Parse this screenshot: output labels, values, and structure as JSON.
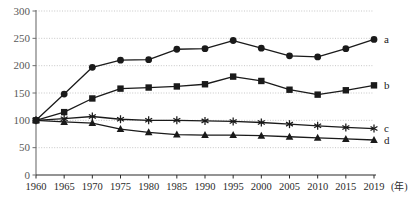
{
  "chart_data": {
    "type": "line",
    "title": "",
    "subtitle": "",
    "xlabel": "",
    "ylabel": "",
    "x_unit": "(年)",
    "grid": true,
    "legend_position": "right-inline",
    "xlim": [
      1960,
      2019
    ],
    "ylim": [
      0,
      300
    ],
    "yticks": [
      0,
      50,
      100,
      150,
      200,
      250,
      300
    ],
    "ytick_labels": [
      "0",
      "50",
      "100",
      "150",
      "200",
      "250",
      "300"
    ],
    "x": [
      1960,
      1965,
      1970,
      1975,
      1980,
      1985,
      1990,
      1995,
      2000,
      2005,
      2010,
      2015,
      2019
    ],
    "xtick_labels": [
      "1960",
      "1965",
      "1970",
      "1975",
      "1980",
      "1985",
      "1990",
      "1995",
      "2000",
      "2005",
      "2010",
      "2015",
      "2019"
    ],
    "series": [
      {
        "name": "a",
        "marker": "circle",
        "color": "#1a1a1a",
        "values": [
          100,
          148,
          197,
          210,
          211,
          230,
          231,
          246,
          232,
          218,
          216,
          231,
          248
        ]
      },
      {
        "name": "b",
        "marker": "square",
        "color": "#1a1a1a",
        "values": [
          100,
          115,
          140,
          158,
          160,
          162,
          166,
          180,
          172,
          156,
          147,
          155,
          164
        ]
      },
      {
        "name": "c",
        "marker": "asterisk",
        "color": "#1a1a1a",
        "values": [
          100,
          103,
          107,
          102,
          100,
          100,
          99,
          98,
          96,
          93,
          90,
          87,
          85
        ]
      },
      {
        "name": "d",
        "marker": "triangle",
        "color": "#1a1a1a",
        "values": [
          100,
          97,
          95,
          84,
          78,
          74,
          73,
          73,
          72,
          70,
          68,
          66,
          64
        ]
      }
    ]
  },
  "axis": {
    "y_axis_name": "value-axis",
    "x_axis_name": "year-axis"
  }
}
